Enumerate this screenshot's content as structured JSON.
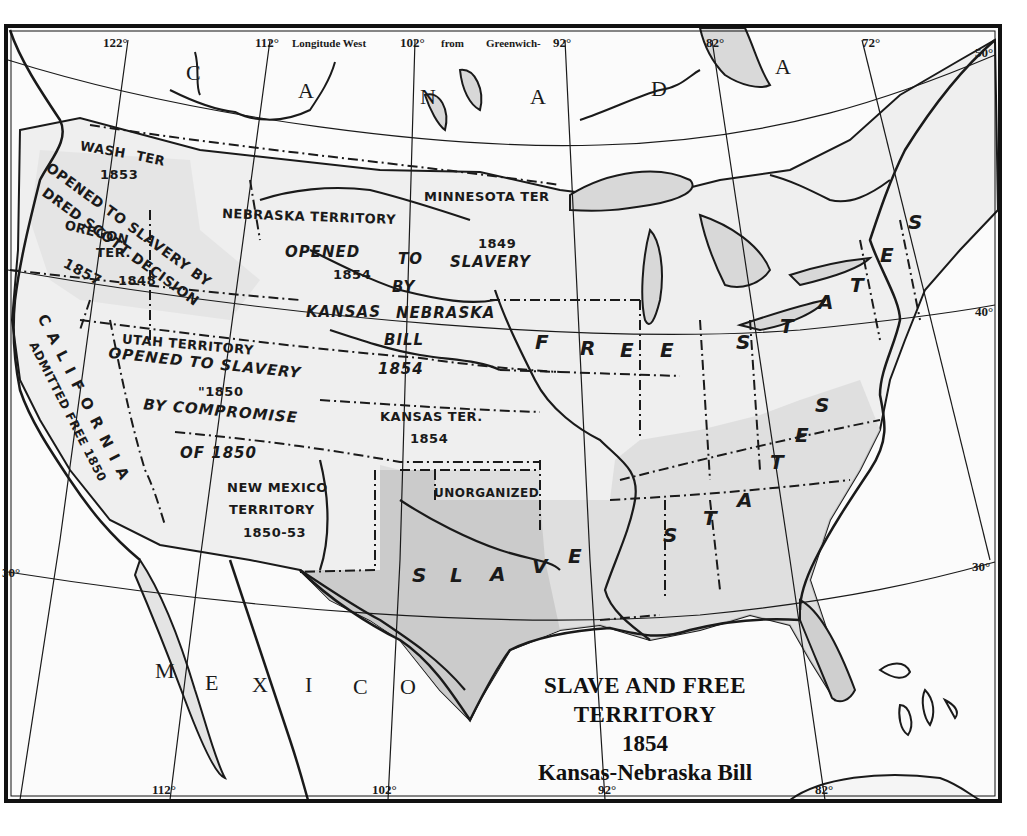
{
  "map": {
    "title": {
      "line1": "SLAVE AND FREE",
      "line2": "TERRITORY",
      "line3": "1854",
      "line4": "Kansas-Nebraska Bill"
    },
    "colors": {
      "paper": "#fbfbfb",
      "land_shade": "#d9d9d9",
      "slave_shade": "#c8c8c8",
      "ink": "#1a1a1a",
      "frame": "#111111"
    },
    "graticule": {
      "top_longitude_header": {
        "lon_122": "122°",
        "lon_112": "112°",
        "caption_a": "Longitude West",
        "lon_102": "102°",
        "caption_b": "from",
        "caption_c": "Greenwich-",
        "lon_92": "92°",
        "lon_82": "82°",
        "lon_72": "72°"
      },
      "bottom_longitudes": {
        "lon_112": "112°",
        "lon_102": "102°",
        "lon_92": "92°",
        "lon_82": "82°"
      },
      "latitudes": {
        "lat_50": "50°",
        "lat_40": "40°",
        "lat_30_right": "30°",
        "lat_30_left": "30°"
      }
    },
    "countries": {
      "canada_letters": [
        "C",
        "A",
        "N",
        "A",
        "D",
        "A"
      ],
      "mexico_letters": [
        "M",
        "E",
        "X",
        "I",
        "C",
        "O"
      ]
    },
    "regions": {
      "washington": {
        "name_a": "WASH",
        "name_b": "TER",
        "year": "1853"
      },
      "oregon": {
        "name_a": "OREGON",
        "name_b": "TER.",
        "year": "1848"
      },
      "dred_scott": {
        "line1": "OPENED TO SLAVERY BY",
        "line2": "DRED SCOTT DECISION",
        "year": "1857"
      },
      "nebraska": {
        "name": "NEBRASKA TERRITORY",
        "line_opened": "OPENED",
        "line_to": "TO",
        "line_slavery": "SLAVERY",
        "year": "1854",
        "line_by": "BY",
        "line_kansas": "KANSAS",
        "line_nebraska": "NEBRASKA",
        "line_bill": "BILL",
        "year_bill": "1854"
      },
      "minnesota": {
        "name": "MINNESOTA TER",
        "year": "1849"
      },
      "utah": {
        "name": "UTAH TERRITORY",
        "line1": "OPENED TO SLAVERY",
        "line2": "\"1850",
        "line3": "BY COMPROMISE",
        "line4": "OF 1850"
      },
      "california": {
        "name": "CALIFORNIA",
        "note": "ADMITTED FREE 1850"
      },
      "kansas": {
        "name": "KANSAS TER.",
        "year": "1854"
      },
      "new_mexico": {
        "line1": "NEW MEXICO",
        "line2": "TERRITORY",
        "year": "1850-53"
      },
      "unorganized": {
        "name": "UNORGANIZED"
      },
      "free_states_letters": [
        "F",
        "R",
        "E",
        "E",
        "S",
        "T",
        "A",
        "T",
        "E",
        "S"
      ],
      "slave_states_letters": [
        "S",
        "L",
        "A",
        "V",
        "E",
        "S",
        "T",
        "A",
        "T",
        "E",
        "S"
      ]
    }
  }
}
